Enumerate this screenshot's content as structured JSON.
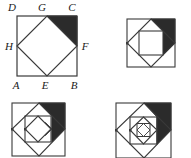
{
  "figure": {
    "panel_count": 4,
    "stroke_color": "#3a3a3a",
    "shade_color": "#2b2b2b",
    "background_color": "#ffffff",
    "fill_color": "#ffffff"
  },
  "panels": [
    {
      "id": "panel-1",
      "name": "square-abcd-with-inscribed-square",
      "nesting_levels": 1,
      "labeled": true,
      "shaded_corner": "top-right",
      "square_side_px": 60,
      "labels": [
        {
          "key": "D",
          "text": "D",
          "position": "top-left",
          "x": 6,
          "y": 9
        },
        {
          "key": "G",
          "text": "G",
          "position": "top-middle",
          "x": 35,
          "y": 9
        },
        {
          "key": "C",
          "text": "C",
          "position": "top-right",
          "x": 64,
          "y": 9
        },
        {
          "key": "H",
          "text": "H",
          "position": "left-middle",
          "x": 0,
          "y": 46
        },
        {
          "key": "F",
          "text": "F",
          "position": "right-middle",
          "x": 71,
          "y": 46
        },
        {
          "key": "A",
          "text": "A",
          "position": "bottom-left",
          "x": 7,
          "y": 82
        },
        {
          "key": "E",
          "text": "E",
          "position": "bottom-middle",
          "x": 35,
          "y": 82
        },
        {
          "key": "B",
          "text": "B",
          "position": "bottom-right",
          "x": 64,
          "y": 82
        }
      ]
    },
    {
      "id": "panel-2",
      "name": "two-level-nested-squares",
      "nesting_levels": 2,
      "labeled": false,
      "shaded_corner": "top-right",
      "square_side_px": 49
    },
    {
      "id": "panel-3",
      "name": "three-level-nested-squares",
      "nesting_levels": 3,
      "labeled": false,
      "shaded_corner": "top-right",
      "square_side_px": 53
    },
    {
      "id": "panel-4",
      "name": "four-level-nested-squares",
      "nesting_levels": 4,
      "labeled": false,
      "shaded_corner": "top-right",
      "square_side_px": 55
    }
  ]
}
